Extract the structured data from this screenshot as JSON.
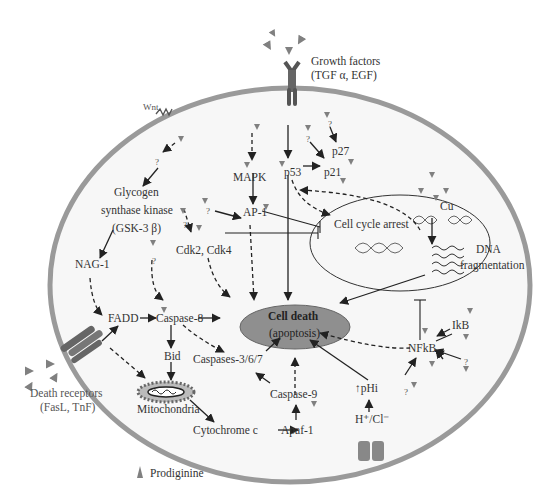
{
  "diagram": {
    "external_labels": {
      "growth_factors": "Growth factors",
      "growth_factors_examples": "(TGF α, EGF)",
      "wnt": "Wnt",
      "death_receptors": "Death receptors",
      "death_receptors_examples": "(FasL, TnF)"
    },
    "nodes": {
      "glycogen": "Glycogen",
      "synthase_kinase": "synthase kinase",
      "gsk3b": "(GSK-3 β)",
      "nag1": "NAG-1",
      "mapk": "MAPK",
      "ap1": "AP-1",
      "cdk": "Cdk2, Cdk4",
      "p53": "p53",
      "p21": "p21",
      "p27": "p27",
      "fadd": "FADD",
      "caspase8": "Caspase-8",
      "bid": "Bid",
      "mitochondria": "Mitochondria",
      "cytochrome_c": "Cytochrome c",
      "apaf1": "Apaf-1",
      "caspase9": "Caspase-9",
      "caspases_367": "Caspases-3/6/7",
      "cell_death": "Cell death",
      "apoptosis": "(apoptosis)",
      "phi": "↑pHi",
      "h_cl": "H⁺/Cl⁻",
      "nfkb": "NFkB",
      "ikb": "IkB",
      "cell_cycle_arrest": "Cell cycle arrest",
      "cu": "Cu",
      "dna": "DNA",
      "fragmentation": "fragmentation",
      "unknown": "?"
    },
    "legend": {
      "symbol": "triangle",
      "label": "Prodiginine"
    },
    "colors": {
      "membrane": "#9a9a9a",
      "cell_fill": "#f7f7f7",
      "cell_death_fill": "#8f8f8f",
      "prodiginine": "#808080",
      "arrow": "#222222",
      "text": "#333333"
    }
  }
}
